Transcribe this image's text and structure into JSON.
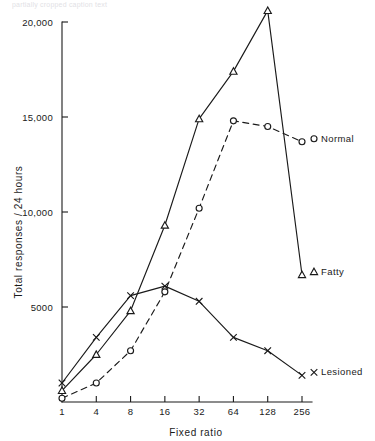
{
  "top_caption": "partially cropped caption text",
  "chart_data": {
    "type": "line",
    "title": "",
    "xlabel": "Fixed ratio",
    "ylabel": "Total responses / 24 hours",
    "x_scale": "log2-evenly-spaced",
    "x_categories": [
      "1",
      "4",
      "8",
      "16",
      "32",
      "64",
      "128",
      "256"
    ],
    "x_tick_labels": [
      "1",
      "4",
      "8",
      "16",
      "32",
      "64",
      "128",
      "256"
    ],
    "y_tick_labels": [
      "5000",
      "10,000",
      "15,000",
      "20,000"
    ],
    "y_tick_values": [
      5000,
      10000,
      15000,
      20000
    ],
    "ylim": [
      0,
      20800
    ],
    "grid": false,
    "legend_position": "right-inline-at-line-ends",
    "series": [
      {
        "name": "Normal",
        "label": "Normal",
        "marker": "circle",
        "line_style": "dashed",
        "values": [
          200,
          1000,
          2700,
          5800,
          10200,
          14800,
          14500,
          13700
        ]
      },
      {
        "name": "Fatty",
        "label": "Fatty",
        "marker": "triangle",
        "line_style": "solid",
        "values": [
          600,
          2500,
          4800,
          9300,
          14900,
          17400,
          20600,
          6700
        ]
      },
      {
        "name": "Lesioned",
        "label": "Lesioned",
        "marker": "x",
        "line_style": "solid",
        "values": [
          1000,
          3400,
          5600,
          6100,
          5300,
          3400,
          2700,
          1400
        ]
      }
    ],
    "colors": {
      "ink": "#1a1a1a",
      "background": "#ffffff"
    }
  }
}
